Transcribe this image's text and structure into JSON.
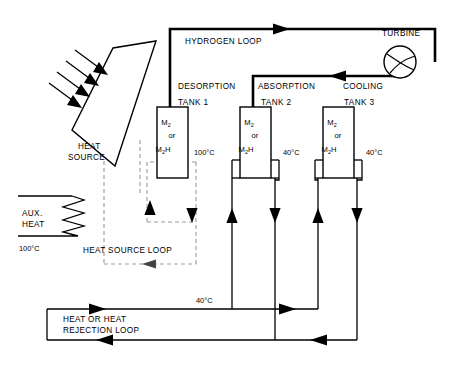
{
  "diagram": {
    "labels": {
      "hydrogen_loop": "HYDROGEN LOOP",
      "turbine": "TURBINE",
      "desorption": "DESORPTION",
      "absorption": "ABSORPTION",
      "cooling": "COOLING",
      "heat_source": "HEAT",
      "heat_source_2": "SOURCE",
      "aux_heat_1": "AUX.",
      "aux_heat_2": "HEAT",
      "heat_source_loop": "HEAT SOURCE LOOP",
      "rejection_loop_1": "HEAT OR HEAT",
      "rejection_loop_2": "REJECTION LOOP"
    },
    "tanks": [
      {
        "name": "TANK 1",
        "species_top": "M",
        "species_top_sub": "2",
        "conjunction": "or",
        "species_bottom": "M",
        "species_bottom_sub": "2",
        "species_bottom_suffix": "H",
        "temperature": "100°C",
        "process": "DESORPTION"
      },
      {
        "name": "TANK 2",
        "species_top": "M",
        "species_top_sub": "2",
        "conjunction": "or",
        "species_bottom": "M",
        "species_bottom_sub": "2",
        "species_bottom_suffix": "H",
        "temperature": "40°C",
        "process": "ABSORPTION"
      },
      {
        "name": "TANK 3",
        "species_top": "M",
        "species_top_sub": "2",
        "conjunction": "or",
        "species_bottom": "M",
        "species_bottom_sub": "2",
        "species_bottom_suffix": "H",
        "temperature": "40°C",
        "process": "COOLING"
      }
    ],
    "temperatures": {
      "aux_heat": "100°C",
      "rejection_inlet": "40°C"
    },
    "colors": {
      "line": "#000000",
      "dashed": "#9a9a9a",
      "background": "#ffffff"
    }
  }
}
